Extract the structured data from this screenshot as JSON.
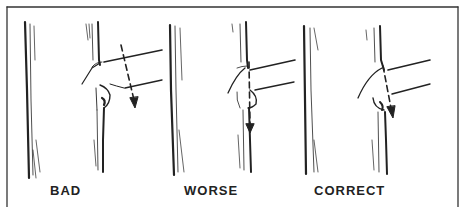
{
  "diagram": {
    "panels": [
      {
        "id": "bad",
        "label": "BAD"
      },
      {
        "id": "worse",
        "label": "WORSE"
      },
      {
        "id": "correct",
        "label": "CORRECT"
      }
    ],
    "colors": {
      "ink": "#222222",
      "background": "#ffffff",
      "border": "#333333"
    }
  }
}
